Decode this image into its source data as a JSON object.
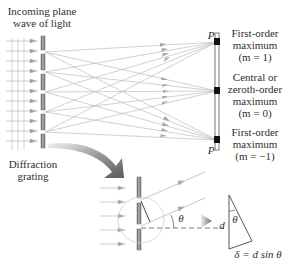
{
  "figure": {
    "title_labels": {
      "incoming": [
        "Incoming plane",
        "wave of light"
      ],
      "grating": [
        "Diffraction",
        "grating"
      ]
    },
    "screen_point_label": "P",
    "maxima": [
      {
        "lines": [
          "First-order",
          "maximum",
          "(m = 1)"
        ],
        "order": 1
      },
      {
        "lines": [
          "Central or",
          "zeroth-order",
          "maximum",
          "(m = 0)"
        ],
        "order": 0
      },
      {
        "lines": [
          "First-order",
          "maximum",
          "(m = −1)"
        ],
        "order": -1
      }
    ],
    "inset": {
      "angle_label": "θ",
      "triangle_side_label": "d",
      "triangle_angle_label": "θ",
      "path_difference": "δ = d sin θ"
    },
    "colors": {
      "ray": "#b8b8b8",
      "slit": "#8a8a8a",
      "screen_spot": "#111111",
      "arrow_big": "#7a7a7a"
    }
  }
}
